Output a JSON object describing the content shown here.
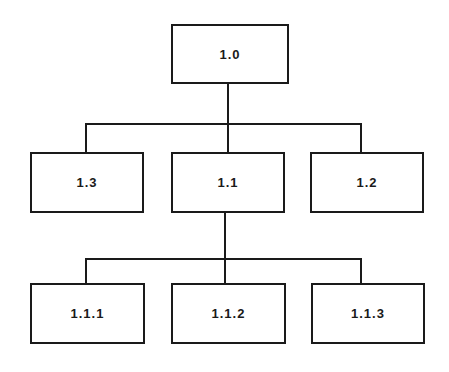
{
  "diagram": {
    "type": "tree",
    "nodes": [
      {
        "id": "1.0",
        "label": "1.0",
        "level": 0
      },
      {
        "id": "1.3",
        "label": "1.3",
        "level": 1,
        "parent": "1.0"
      },
      {
        "id": "1.1",
        "label": "1.1",
        "level": 1,
        "parent": "1.0"
      },
      {
        "id": "1.2",
        "label": "1.2",
        "level": 1,
        "parent": "1.0"
      },
      {
        "id": "1.1.1",
        "label": "1.1.1",
        "level": 2,
        "parent": "1.1"
      },
      {
        "id": "1.1.2",
        "label": "1.1.2",
        "level": 2,
        "parent": "1.1"
      },
      {
        "id": "1.1.3",
        "label": "1.1.3",
        "level": 2,
        "parent": "1.1"
      }
    ],
    "colors": {
      "line": "#1a1a1a",
      "background": "#ffffff"
    }
  }
}
